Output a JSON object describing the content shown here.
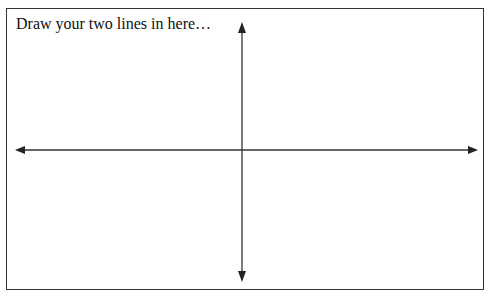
{
  "worksheet": {
    "prompt": "Draw your two lines in here…",
    "axes": {
      "horizontal": "bidirectional-arrow",
      "vertical": "bidirectional-arrow"
    },
    "colors": {
      "line": "#333333",
      "border": "#333333",
      "background": "#ffffff"
    }
  }
}
